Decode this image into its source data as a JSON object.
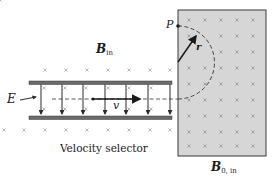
{
  "labels": {
    "b_in": {
      "main": "B",
      "sub": "in"
    },
    "b0_in": {
      "main": "B",
      "sub": "0, in"
    },
    "e_field": "E",
    "velocity": "v",
    "radius": "r",
    "point": "P",
    "caption": "Velocity selector"
  },
  "colors": {
    "plate": "#6b6b6b",
    "field_line": "#2a2a2a",
    "region_fill": "#d6d6d6",
    "region_border": "#3a3a3a",
    "cross": "#8a8a8a",
    "path": "#333333"
  }
}
